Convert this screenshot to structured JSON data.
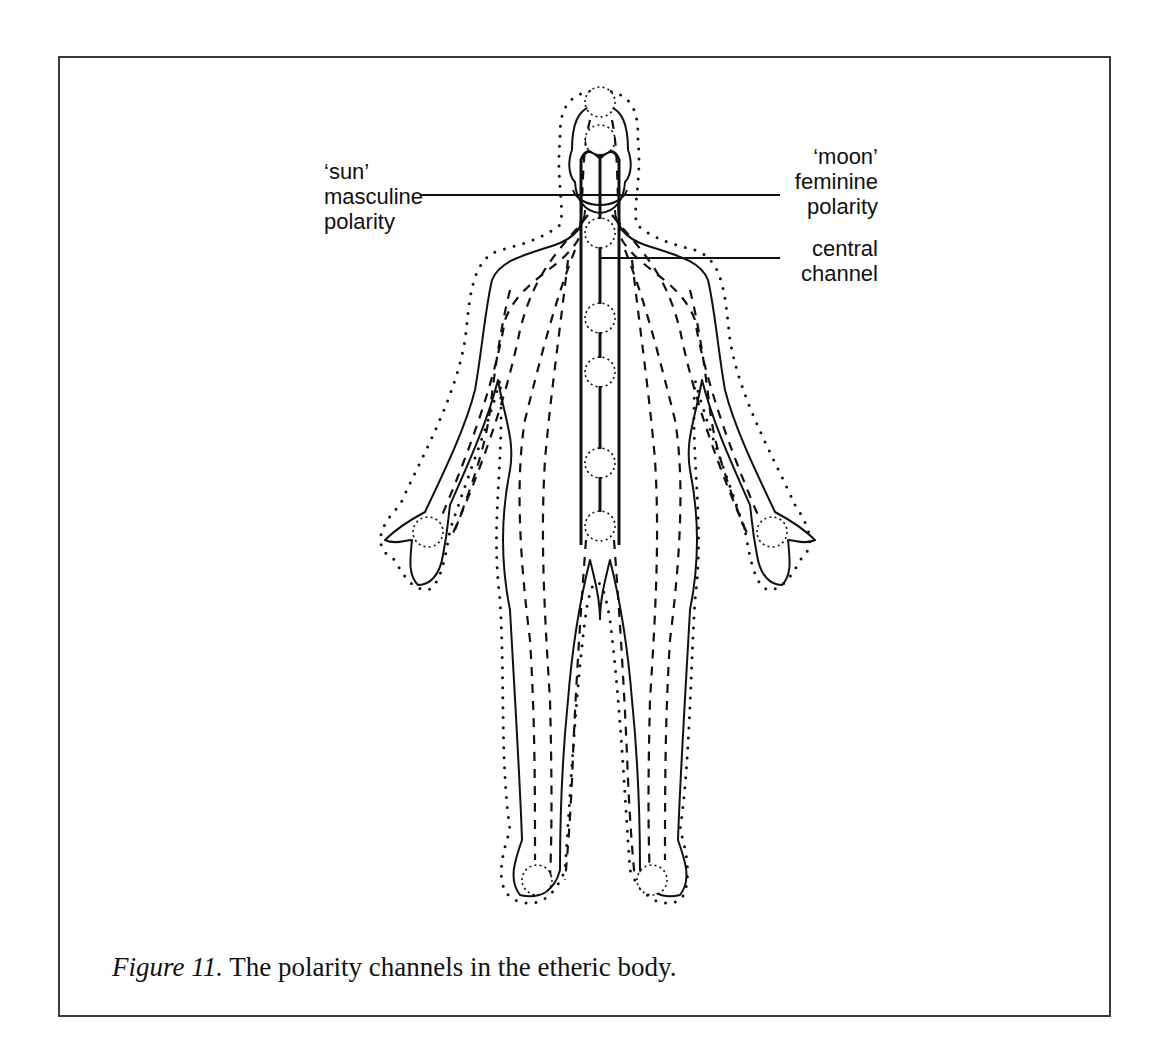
{
  "figure": {
    "labels": {
      "sun": "‘sun’\nmasculine\npolarity",
      "moon": "‘moon’\nfeminine\npolarity",
      "central": "central\nchannel"
    },
    "caption": {
      "number": "Figure 11.",
      "text": " The polarity channels in the etheric body."
    },
    "colors": {
      "ink": "#111111",
      "frame": "#3a3a3a",
      "background": "#ffffff"
    },
    "chakra_points": [
      "crown",
      "brow",
      "throat",
      "heart",
      "solar-plexus",
      "sacral",
      "root",
      "left-palm",
      "right-palm",
      "left-sole",
      "right-sole"
    ]
  }
}
